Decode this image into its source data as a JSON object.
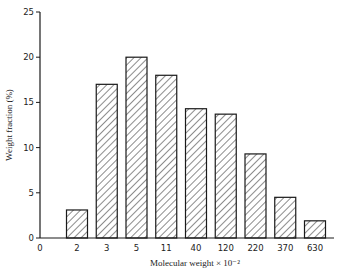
{
  "chart_data": {
    "type": "bar",
    "title": "",
    "xlabel": "Molecular weight × 10⁻²",
    "ylabel": "Weight fraction (%)",
    "categories": [
      "2",
      "3",
      "5",
      "11",
      "40",
      "120",
      "220",
      "370",
      "630"
    ],
    "values": [
      3.1,
      17.0,
      20.0,
      18.0,
      14.3,
      13.7,
      9.3,
      4.5,
      1.9
    ],
    "x_origin_label": "0",
    "yticks": [
      0,
      5,
      10,
      15,
      20,
      25
    ],
    "ylim": [
      0,
      25
    ],
    "grid": false,
    "legend": null,
    "bar_fill": "diagonal hatch",
    "colors": {
      "line": "#1a1a1a",
      "background": "#ffffff"
    }
  }
}
